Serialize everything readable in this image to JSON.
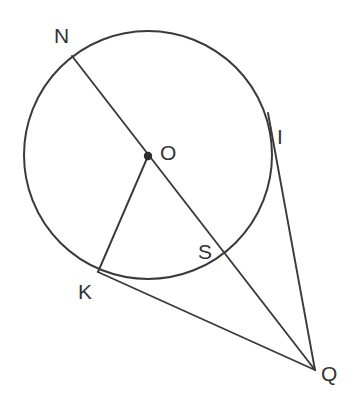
{
  "figure": {
    "type": "geometry-diagram",
    "width": 361,
    "height": 418,
    "background_color": "#ffffff",
    "stroke_color": "#3a3a3a",
    "label_color": "#333333"
  },
  "circle": {
    "name": "circle-O",
    "center_label": "O",
    "center_x": 148,
    "center_y": 155,
    "radius": 124
  },
  "points": [
    {
      "id": "N",
      "label": "N",
      "x": 72,
      "y": 56,
      "label_x": 54,
      "label_y": 25,
      "on_circle": true,
      "dot": false
    },
    {
      "id": "O",
      "label": "O",
      "x": 148,
      "y": 156,
      "label_x": 160,
      "label_y": 142,
      "on_circle": false,
      "dot": true
    },
    {
      "id": "I",
      "label": "I",
      "x": 268,
      "y": 113,
      "label_x": 277,
      "label_y": 126,
      "on_circle": true,
      "dot": false
    },
    {
      "id": "S",
      "label": "S",
      "x": 228,
      "y": 258,
      "label_x": 198,
      "label_y": 241,
      "on_circle": true,
      "dot": false
    },
    {
      "id": "K",
      "label": "K",
      "x": 98,
      "y": 272,
      "label_x": 78,
      "label_y": 281,
      "on_circle": true,
      "dot": false
    },
    {
      "id": "Q",
      "label": "Q",
      "x": 315,
      "y": 370,
      "label_x": 321,
      "label_y": 363,
      "on_circle": false,
      "dot": false
    }
  ],
  "segments": [
    {
      "id": "NQ",
      "name": "secant-n-to-q",
      "from": "N",
      "to": "Q",
      "passes_through": [
        "O",
        "S"
      ]
    },
    {
      "id": "OK",
      "name": "radius-o-to-k",
      "from": "O",
      "to": "K",
      "passes_through": []
    },
    {
      "id": "KQ",
      "name": "secant-k-to-q",
      "from": "K",
      "to": "Q",
      "passes_through": []
    },
    {
      "id": "IQ",
      "name": "tangent-i-to-q",
      "from": "I",
      "to": "Q",
      "passes_through": []
    }
  ]
}
